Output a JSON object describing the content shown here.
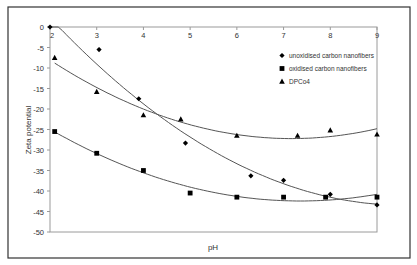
{
  "chart_data": {
    "type": "scatter",
    "title": "",
    "xlabel": "pH",
    "ylabel": "Zeta potential",
    "xlim": [
      2,
      9
    ],
    "ylim": [
      -50,
      0
    ],
    "x_ticks": [
      2,
      3,
      4,
      5,
      6,
      7,
      8,
      9
    ],
    "y_ticks": [
      0,
      -5,
      -10,
      -15,
      -20,
      -25,
      -30,
      -35,
      -40,
      -45,
      -50
    ],
    "x_axis_position": "top (at y=0)",
    "grid": false,
    "legend_position": "upper right inside plot",
    "series": [
      {
        "name": "unoxidised carbon nanofibers",
        "marker": "diamond",
        "x": [
          2,
          3.05,
          3.9,
          4.9,
          6.3,
          7,
          8,
          9
        ],
        "y": [
          0,
          -5.5,
          -17.5,
          -28.3,
          -36.3,
          -37.4,
          -40.8,
          -43.4
        ],
        "trendline": "polynomial"
      },
      {
        "name": "oxidised carbon nanofibers",
        "marker": "square",
        "x": [
          2.1,
          3,
          4,
          5,
          6,
          7,
          7.9,
          9
        ],
        "y": [
          -25.5,
          -30.8,
          -35,
          -40.5,
          -41.5,
          -41.5,
          -41.5,
          -41.5
        ],
        "trendline": "polynomial"
      },
      {
        "name": "DPCo4",
        "marker": "triangle",
        "x": [
          2.1,
          3,
          4,
          4.8,
          6,
          7.3,
          8,
          9
        ],
        "y": [
          -7.5,
          -15.8,
          -21.5,
          -22.5,
          -26.5,
          -26.5,
          -25.2,
          -26.2
        ],
        "trendline": "polynomial"
      }
    ]
  },
  "legend": {
    "items": [
      {
        "label": "unoxidised carbon nanofibers",
        "marker": "diamond"
      },
      {
        "label": "oxidised carbon nanofibers",
        "marker": "square"
      },
      {
        "label": "DPCo4",
        "marker": "triangle"
      }
    ]
  },
  "axes": {
    "xlabel": "pH",
    "ylabel": "Zeta potential"
  },
  "colors": {
    "frame": "#333333",
    "axis": "#9a9a9a",
    "marker": "#000000",
    "trendline": "#555555"
  }
}
